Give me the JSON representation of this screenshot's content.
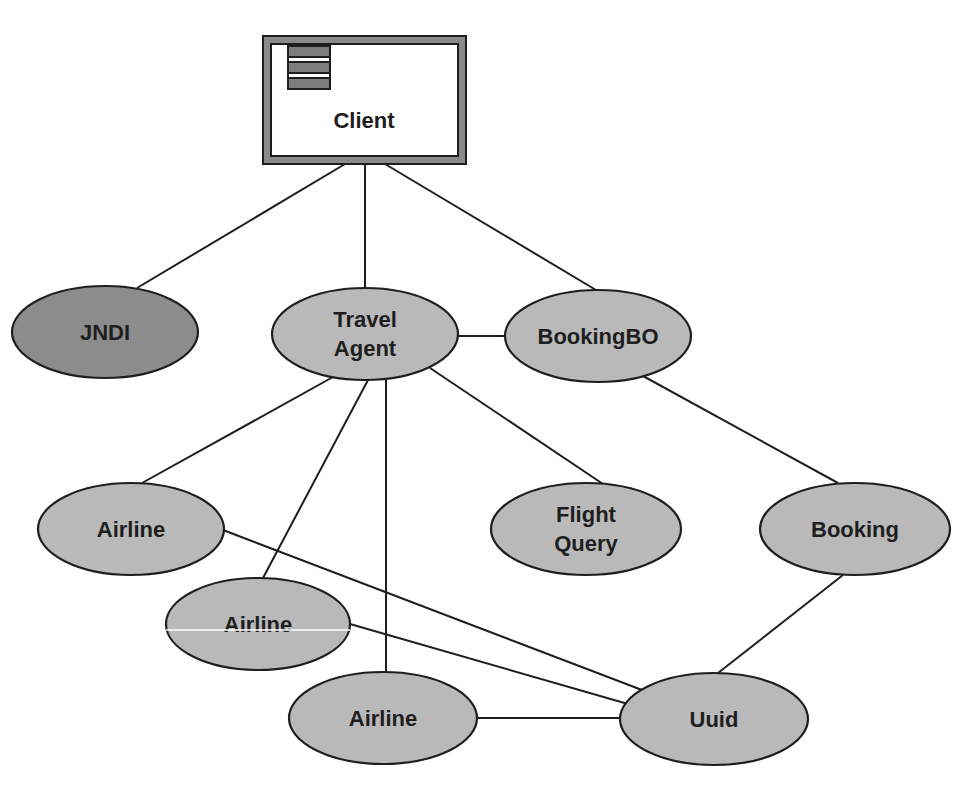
{
  "diagram": {
    "title": "",
    "colors": {
      "background": "#ffffff",
      "stroke": "#1e1e1e",
      "node_fill": "#b9b9b9",
      "jndi_fill": "#8c8c8c",
      "client_frame": "#8a8a8a",
      "client_inner": "#ffffff",
      "client_icon_bar": "#7d7d7d"
    },
    "client": {
      "label": "Client",
      "icon": "window-list-icon",
      "x": 262,
      "y": 35,
      "width": 205,
      "height": 130
    },
    "nodes": [
      {
        "id": "jndi",
        "lines": [
          "JNDI"
        ],
        "cx": 105,
        "cy": 332,
        "rx": 93,
        "ry": 46,
        "fill": "dark"
      },
      {
        "id": "travel-agent",
        "lines": [
          "Travel",
          "Agent"
        ],
        "cx": 365,
        "cy": 334,
        "rx": 93,
        "ry": 46,
        "fill": "normal"
      },
      {
        "id": "bookingbo",
        "lines": [
          "BookingBO"
        ],
        "cx": 598,
        "cy": 336,
        "rx": 93,
        "ry": 46,
        "fill": "normal"
      },
      {
        "id": "airline-1",
        "lines": [
          "Airline"
        ],
        "cx": 131,
        "cy": 529,
        "rx": 93,
        "ry": 46,
        "fill": "normal"
      },
      {
        "id": "flight-query",
        "lines": [
          "Flight",
          "Query"
        ],
        "cx": 586,
        "cy": 529,
        "rx": 95,
        "ry": 46,
        "fill": "normal"
      },
      {
        "id": "booking",
        "lines": [
          "Booking"
        ],
        "cx": 855,
        "cy": 529,
        "rx": 95,
        "ry": 46,
        "fill": "normal"
      },
      {
        "id": "airline-2",
        "lines": [
          "Airline"
        ],
        "cx": 258,
        "cy": 624,
        "rx": 92,
        "ry": 46,
        "fill": "normal"
      },
      {
        "id": "airline-3",
        "lines": [
          "Airline"
        ],
        "cx": 383,
        "cy": 718,
        "rx": 94,
        "ry": 46,
        "fill": "normal"
      },
      {
        "id": "uuid",
        "lines": [
          "Uuid"
        ],
        "cx": 714,
        "cy": 719,
        "rx": 94,
        "ry": 46,
        "fill": "normal"
      }
    ],
    "edges": [
      {
        "from": "client",
        "to": "jndi",
        "x1": 345,
        "y1": 164,
        "x2": 137,
        "y2": 288
      },
      {
        "from": "client",
        "to": "travel-agent",
        "x1": 365,
        "y1": 164,
        "x2": 365,
        "y2": 288
      },
      {
        "from": "client",
        "to": "bookingbo",
        "x1": 385,
        "y1": 164,
        "x2": 596,
        "y2": 290
      },
      {
        "from": "travel-agent",
        "to": "bookingbo",
        "x1": 458,
        "y1": 336,
        "x2": 505,
        "y2": 336
      },
      {
        "from": "travel-agent",
        "to": "airline-1",
        "x1": 333,
        "y1": 377,
        "x2": 142,
        "y2": 483
      },
      {
        "from": "travel-agent",
        "to": "airline-2",
        "x1": 368,
        "y1": 380,
        "x2": 263,
        "y2": 578
      },
      {
        "from": "travel-agent",
        "to": "airline-3",
        "x1": 386,
        "y1": 380,
        "x2": 386,
        "y2": 672
      },
      {
        "from": "travel-agent",
        "to": "flight-query",
        "x1": 430,
        "y1": 368,
        "x2": 603,
        "y2": 484
      },
      {
        "from": "bookingbo",
        "to": "booking",
        "x1": 643,
        "y1": 376,
        "x2": 838,
        "y2": 483
      },
      {
        "from": "airline-1",
        "to": "uuid",
        "x1": 223,
        "y1": 530,
        "x2": 642,
        "y2": 690
      },
      {
        "from": "airline-2",
        "to": "uuid",
        "x1": 350,
        "y1": 624,
        "x2": 628,
        "y2": 704
      },
      {
        "from": "airline-3",
        "to": "uuid",
        "x1": 476,
        "y1": 718,
        "x2": 620,
        "y2": 718
      },
      {
        "from": "booking",
        "to": "uuid",
        "x1": 843,
        "y1": 575,
        "x2": 718,
        "y2": 673
      }
    ]
  }
}
